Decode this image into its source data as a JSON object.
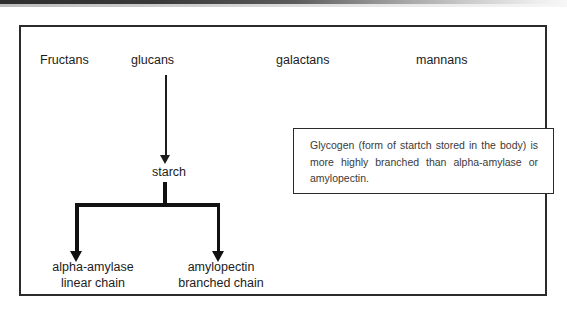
{
  "diagram": {
    "top_row": [
      {
        "id": "fructans",
        "label": "Fructans"
      },
      {
        "id": "glucans",
        "label": "glucans"
      },
      {
        "id": "galactans",
        "label": "galactans"
      },
      {
        "id": "mannans",
        "label": "mannans"
      }
    ],
    "intermediate_node": {
      "id": "starch",
      "label": "starch"
    },
    "products": [
      {
        "id": "alpha-amylase",
        "line1": "alpha-amylase",
        "line2": "linear chain"
      },
      {
        "id": "amylopectin",
        "line1": "amylopectin",
        "line2": "branched chain"
      }
    ],
    "note_box": {
      "text": "Glycogen (form of startch stored in the body) is more highly branched than alpha-amylase or amylopectin."
    },
    "connectors": [
      {
        "id": "glucans-to-starch",
        "from": "glucans",
        "to": "starch",
        "style": "thin-arrow-down"
      },
      {
        "id": "starch-to-alpha-amylase",
        "from": "starch",
        "to": "alpha-amylase",
        "style": "thick-branch-arrow"
      },
      {
        "id": "starch-to-amylopectin",
        "from": "starch",
        "to": "amylopectin",
        "style": "thick-branch-arrow"
      }
    ],
    "colors": {
      "frame_border": "#2b2b2b",
      "note_border": "#2b2b2b",
      "text": "#1c1c1c",
      "note_text": "#3a3a3a",
      "connector": "#111111",
      "background": "#ffffff"
    }
  }
}
